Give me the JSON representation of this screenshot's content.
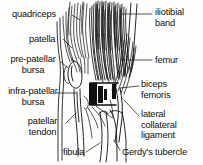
{
  "diagram": {
    "background_color": "#fdfdfc",
    "ink_color": "#101010",
    "labels": [
      {
        "id": "quadriceps",
        "text": "quadriceps",
        "side": "left",
        "x": 12,
        "y": 9,
        "lines": [
          "quadriceps"
        ]
      },
      {
        "id": "patella",
        "text": "patella",
        "side": "left",
        "x": 29,
        "y": 34,
        "lines": [
          "patella"
        ]
      },
      {
        "id": "pre-patellar-bursa",
        "text": "pre-patellar bursa",
        "side": "left",
        "x": 4,
        "y": 55,
        "lines": [
          "pre-patellar",
          "bursa"
        ]
      },
      {
        "id": "infra-patellar-bursa",
        "text": "infra-patellar bursa",
        "side": "left",
        "x": 3,
        "y": 87,
        "lines": [
          "infra-patellar",
          "bursa"
        ]
      },
      {
        "id": "patellar-tendon",
        "text": "patellar tendon",
        "side": "left",
        "x": 26,
        "y": 117,
        "lines": [
          "patellar",
          "tendon"
        ]
      },
      {
        "id": "fibula",
        "text": "fibula",
        "side": "left",
        "x": 63,
        "y": 148,
        "lines": [
          "fibula"
        ]
      },
      {
        "id": "iliotibial-band",
        "text": "iliotibial band",
        "side": "right",
        "x": 155,
        "y": 8,
        "lines": [
          "iliotibial",
          "band"
        ]
      },
      {
        "id": "femur",
        "text": "femur",
        "side": "right",
        "x": 155,
        "y": 56,
        "lines": [
          "femur"
        ]
      },
      {
        "id": "biceps-femoris",
        "text": "biceps femoris",
        "side": "right",
        "x": 141,
        "y": 80,
        "lines": [
          "biceps",
          "femoris"
        ]
      },
      {
        "id": "lateral-collateral-ligament",
        "text": "lateral collateral ligament",
        "side": "right",
        "x": 141,
        "y": 110,
        "lines": [
          "lateral",
          "collateral",
          "ligament"
        ]
      },
      {
        "id": "gerdys-tubercle",
        "text": "Gerdy's tubercle",
        "side": "right",
        "x": 122,
        "y": 148,
        "lines": [
          "Gerdy's tubercle"
        ]
      }
    ],
    "structures": [
      {
        "id": "quadriceps-tendon-bundle",
        "kind": "fiber-bundle",
        "description": "striated quadriceps tendon fibers, upper left of drawing"
      },
      {
        "id": "iliotibial-tract-bundle",
        "kind": "fiber-bundle",
        "description": "dense dark iliotibial band fibers running vertically through centre"
      },
      {
        "id": "patella-outline",
        "kind": "bone-outline",
        "description": "oval patella at mid-left of drawing"
      },
      {
        "id": "femur-shaft",
        "kind": "bone-outline",
        "description": "femur shaft descending on the right"
      },
      {
        "id": "biceps-femoris-bundle",
        "kind": "fiber-bundle",
        "description": "biceps femoris fibers converging to fibular head"
      },
      {
        "id": "lateral-collateral-ligament-cord",
        "kind": "ligament",
        "description": "cord of lateral collateral ligament"
      },
      {
        "id": "patellar-tendon-strap",
        "kind": "tendon",
        "description": "patellar tendon descending to tibial tuberosity"
      },
      {
        "id": "fibula-head",
        "kind": "bone-outline",
        "description": "fibular head and shaft, lower centre"
      },
      {
        "id": "gerdys-tubercle-point",
        "kind": "bone-landmark",
        "description": "Gerdy's tubercle on the lateral tibial condyle"
      },
      {
        "id": "dark-joint-block",
        "kind": "shading",
        "description": "dense black shading at the lateral joint line"
      }
    ]
  }
}
